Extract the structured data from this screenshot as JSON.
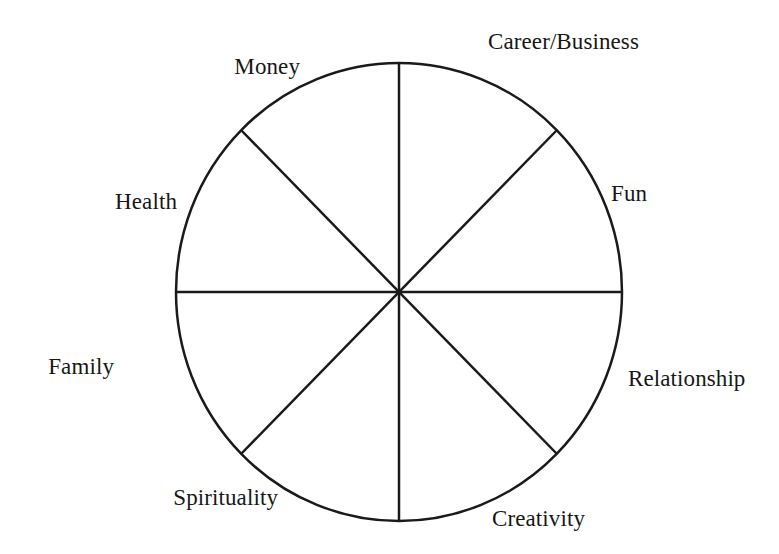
{
  "diagram": {
    "type": "pie-wheel",
    "background_color": "#ffffff",
    "line_color": "#1a1a1a",
    "text_color": "#171717",
    "line_width": 2.5,
    "circle": {
      "center_x": 399,
      "center_y": 292,
      "radius_x": 223,
      "radius_y": 229
    },
    "sector_count": 8,
    "spoke_angles_deg": [
      0,
      45,
      90,
      135,
      180,
      225,
      270,
      315
    ],
    "segments": [
      {
        "label": "Career/Business",
        "position": "top-right",
        "angle_deg": 67.5,
        "label_x": 488,
        "label_y": 41,
        "anchor": "left"
      },
      {
        "label": "Fun",
        "position": "right-upper",
        "angle_deg": 22.5,
        "label_x": 611,
        "label_y": 193,
        "anchor": "left"
      },
      {
        "label": "Relationship",
        "position": "right-lower",
        "angle_deg": -22.5,
        "label_x": 628,
        "label_y": 378,
        "anchor": "left"
      },
      {
        "label": "Creativity",
        "position": "bottom-right",
        "angle_deg": -67.5,
        "label_x": 492,
        "label_y": 518,
        "anchor": "left"
      },
      {
        "label": "Spirituality",
        "position": "bottom-left",
        "angle_deg": -112.5,
        "label_x": 278,
        "label_y": 497,
        "anchor": "right"
      },
      {
        "label": "Family",
        "position": "left-lower",
        "angle_deg": -157.5,
        "label_x": 114,
        "label_y": 366,
        "anchor": "right"
      },
      {
        "label": "Health",
        "position": "left-upper",
        "angle_deg": 157.5,
        "label_x": 177,
        "label_y": 201,
        "anchor": "right"
      },
      {
        "label": "Money",
        "position": "top-left",
        "angle_deg": 112.5,
        "label_x": 300,
        "label_y": 66,
        "anchor": "right"
      }
    ]
  }
}
